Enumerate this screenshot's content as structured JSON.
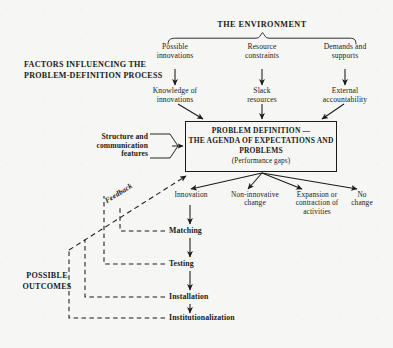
{
  "diagram": {
    "title_env": "THE ENVIRONMENT",
    "section_headings": {
      "factors": "FACTORS INFLUENCING THE\nPROBLEM-DEFINITION PROCESS",
      "outcomes": "POSSIBLE\nOUTCOMES"
    },
    "environment_inputs": [
      {
        "label": "Possible\ninnovations"
      },
      {
        "label": "Resource\nconstraints"
      },
      {
        "label": "Demands and\nsupports"
      }
    ],
    "mediating_factors": [
      {
        "label": "Knowledge of\ninnovations"
      },
      {
        "label": "Slack\nresources"
      },
      {
        "label": "External\naccountability"
      }
    ],
    "side_factor": {
      "label": "Structure and\ncommunication\nfeatures"
    },
    "core_box": {
      "line1": "PROBLEM DEFINITION —",
      "line2": "THE AGENDA OF EXPECTATIONS AND",
      "line3": "PROBLEMS",
      "line4": "(Performance gaps)"
    },
    "outcomes": [
      {
        "label": "Innovation"
      },
      {
        "label": "Non-innovative\nchange"
      },
      {
        "label": "Expansion or\ncontraction of\nactivities"
      },
      {
        "label": "No\nchange"
      }
    ],
    "implementation_chain": [
      {
        "label": "Matching"
      },
      {
        "label": "Testing"
      },
      {
        "label": "Installation"
      },
      {
        "label": "Institutionalization"
      }
    ],
    "feedback_label": "Feedback",
    "colors": {
      "ink": "#1a1a1a",
      "paper": "#f6f6f5"
    }
  }
}
